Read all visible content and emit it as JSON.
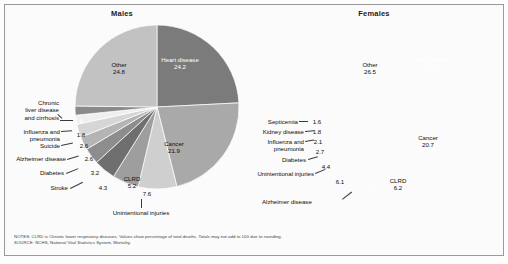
{
  "figure": {
    "notes_line1": "NOTES: CLRD is Chronic lower respiratory diseases. Values show percentage of total deaths. Totals may not add to 100 due to rounding.",
    "notes_line2": "SOURCE: NCHS, National Vital Statistics System, Mortality."
  },
  "panels": [
    {
      "id": "males",
      "title": "Males"
    },
    {
      "id": "females",
      "title": "Females"
    }
  ],
  "males": {
    "inside": {
      "heart_name": "Heart disease",
      "heart_value": "24.2",
      "cancer_name": "Cancer",
      "cancer_value": "21.9",
      "other_name": "Other",
      "other_value": "24.8",
      "clrd_name": "CLRD",
      "clrd_value": "5.2",
      "unintentional_value": "7.6",
      "stroke_value": "4.3",
      "diabetes_value": "3.2",
      "alzheimer_value": "2.6",
      "suicide_value": "2.6",
      "influenza_value": "1.8",
      "liver_value": "1.8"
    },
    "callouts": {
      "liver": "Chronic\nliver disease\nand cirrhosis",
      "liver_l1": "Chronic",
      "liver_l2": "liver disease",
      "liver_l3": "and cirrhosis",
      "influenza_l1": "Influenza and",
      "influenza_l2": "pneumonia",
      "suicide": "Suicide",
      "alzheimer": "Alzheimer disease",
      "diabetes": "Diabetes",
      "stroke": "Stroke",
      "unintentional": "Unintentional injuries"
    }
  },
  "females": {
    "inside": {
      "heart_name": "Heart disease",
      "heart_value": "21.8",
      "cancer_name": "Cancer",
      "cancer_value": "20.7",
      "other_name": "Other",
      "other_value": "26.5",
      "clrd_name": "CLRD",
      "clrd_value": "6.2",
      "stroke_name": "Stroke",
      "stroke_value": "6.2",
      "alzheimer_value": "6.1",
      "unintentional_value": "4.4",
      "diabetes_value": "2.7",
      "influenza_value": "2.1",
      "kidney_value": "1.8",
      "septicemia_value": "1.6"
    },
    "callouts": {
      "septicemia": "Septicemia",
      "kidney": "Kidney disease",
      "influenza_l1": "Influenza and",
      "influenza_l2": "pneumonia",
      "diabetes": "Diabetes",
      "unintentional": "Unintentional injuries",
      "alzheimer": "Alzheimer disease"
    }
  },
  "chart_data": [
    {
      "type": "pie",
      "title": "Males",
      "unit": "percent of total deaths",
      "categories": [
        "Heart disease",
        "Cancer",
        "Unintentional injuries",
        "CLRD",
        "Stroke",
        "Diabetes",
        "Alzheimer disease",
        "Suicide",
        "Influenza and pneumonia",
        "Chronic liver disease and cirrhosis",
        "Other"
      ],
      "values": [
        24.2,
        21.9,
        7.6,
        5.2,
        4.3,
        3.2,
        2.6,
        2.6,
        1.8,
        1.8,
        24.8
      ],
      "colors": [
        "#7b7b7b",
        "#a9a9a9",
        "#cfcfcf",
        "#9e9e9e",
        "#6f6f6f",
        "#8d8d8d",
        "#b4b4b4",
        "#d6d6d6",
        "#efefef",
        "#8a8a8a",
        "#c2c2c2"
      ],
      "start_angle_deg": 0,
      "direction": "clockwise",
      "legend": "none",
      "grid": false
    },
    {
      "type": "pie",
      "title": "Females",
      "unit": "percent of total deaths",
      "categories": [
        "Heart disease",
        "Cancer",
        "CLRD",
        "Stroke",
        "Alzheimer disease",
        "Unintentional injuries",
        "Diabetes",
        "Influenza and pneumonia",
        "Kidney disease",
        "Septicemia",
        "Other"
      ],
      "values": [
        21.8,
        20.7,
        6.2,
        6.2,
        6.1,
        4.4,
        2.7,
        2.1,
        1.8,
        1.6,
        26.5
      ],
      "colors": [
        "#7b7b7b",
        "#a9a9a9",
        "#cfcfcf",
        "#8a8a8a",
        "#b4b4b4",
        "#d6d6d6",
        "#9e9e9e",
        "#6f6f6f",
        "#c7c7c7",
        "#efefef",
        "#c2c2c2"
      ],
      "start_angle_deg": 0,
      "direction": "clockwise",
      "legend": "none",
      "grid": false
    }
  ]
}
